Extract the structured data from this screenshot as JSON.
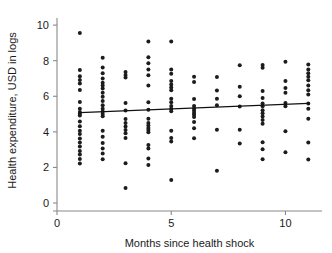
{
  "chart_data": {
    "type": "scatter",
    "title": "",
    "xlabel": "Months since health shock",
    "ylabel": "Health expenditure, USD in logs",
    "xlim": [
      0,
      11.6
    ],
    "ylim": [
      0,
      10.4
    ],
    "xticks": [
      0,
      5,
      10
    ],
    "xtick_labels": [
      "0",
      "5",
      "10"
    ],
    "yticks": [
      0,
      2,
      4,
      6,
      8,
      10
    ],
    "ytick_labels": [
      "0",
      "2",
      "4",
      "6",
      "8",
      "10"
    ],
    "grid": false,
    "legend": false,
    "legend_position": "none",
    "marker": "filled-circle",
    "marker_color": "#1c1c1c",
    "fit_line": {
      "label": "linear fit",
      "color": "#111111",
      "x_start": 1.0,
      "y_start": 5.08,
      "x_end": 11.0,
      "y_end": 5.6,
      "slope": 0.052,
      "intercept": 5.03
    },
    "points": [
      [
        1,
        9.55
      ],
      [
        1,
        7.47
      ],
      [
        1,
        7.12
      ],
      [
        1,
        6.92
      ],
      [
        1,
        6.72
      ],
      [
        1,
        6.35
      ],
      [
        1,
        5.68
      ],
      [
        1,
        5.3
      ],
      [
        1,
        5.12
      ],
      [
        1,
        5.02
      ],
      [
        1,
        4.92
      ],
      [
        1,
        4.58
      ],
      [
        1,
        4.32
      ],
      [
        1,
        4.06
      ],
      [
        1,
        3.88
      ],
      [
        1,
        3.62
      ],
      [
        1,
        3.4
      ],
      [
        1,
        3.18
      ],
      [
        1,
        2.92
      ],
      [
        1,
        2.72
      ],
      [
        1,
        2.48
      ],
      [
        1,
        2.22
      ],
      [
        2,
        8.16
      ],
      [
        2,
        7.62
      ],
      [
        2,
        7.3
      ],
      [
        2,
        7.0
      ],
      [
        2,
        6.76
      ],
      [
        2,
        6.6
      ],
      [
        2,
        6.44
      ],
      [
        2,
        6.2
      ],
      [
        2,
        5.98
      ],
      [
        2,
        5.74
      ],
      [
        2,
        5.5
      ],
      [
        2,
        5.3
      ],
      [
        2,
        5.14
      ],
      [
        2,
        5.0
      ],
      [
        2,
        4.88
      ],
      [
        2,
        4.06
      ],
      [
        2,
        3.72
      ],
      [
        2,
        3.38
      ],
      [
        2,
        3.06
      ],
      [
        2,
        2.78
      ],
      [
        2,
        2.46
      ],
      [
        3,
        7.36
      ],
      [
        3,
        7.2
      ],
      [
        3,
        7.06
      ],
      [
        3,
        5.62
      ],
      [
        3,
        5.2
      ],
      [
        3,
        4.72
      ],
      [
        3,
        4.5
      ],
      [
        3,
        4.3
      ],
      [
        3,
        4.1
      ],
      [
        3,
        3.92
      ],
      [
        3,
        3.66
      ],
      [
        3,
        2.24
      ],
      [
        3,
        0.84
      ],
      [
        4,
        9.08
      ],
      [
        4,
        8.2
      ],
      [
        4,
        7.86
      ],
      [
        4,
        7.5
      ],
      [
        4,
        7.18
      ],
      [
        4,
        6.6
      ],
      [
        4,
        5.66
      ],
      [
        4,
        5.24
      ],
      [
        4,
        4.74
      ],
      [
        4,
        4.5
      ],
      [
        4,
        4.36
      ],
      [
        4,
        4.22
      ],
      [
        4,
        4.1
      ],
      [
        4,
        3.98
      ],
      [
        4,
        3.26
      ],
      [
        4,
        3.06
      ],
      [
        4,
        2.5
      ],
      [
        4,
        2.14
      ],
      [
        5,
        9.08
      ],
      [
        5,
        7.5
      ],
      [
        5,
        7.26
      ],
      [
        5,
        6.86
      ],
      [
        5,
        6.66
      ],
      [
        5,
        6.5
      ],
      [
        5,
        6.34
      ],
      [
        5,
        5.86
      ],
      [
        5,
        5.66
      ],
      [
        5,
        5.46
      ],
      [
        5,
        5.3
      ],
      [
        5,
        5.16
      ],
      [
        5,
        4.06
      ],
      [
        5,
        3.66
      ],
      [
        5,
        3.46
      ],
      [
        5,
        1.3
      ],
      [
        6,
        7.1
      ],
      [
        6,
        6.8
      ],
      [
        6,
        5.84
      ],
      [
        6,
        5.46
      ],
      [
        6,
        5.3
      ],
      [
        6,
        5.18
      ],
      [
        6,
        5.06
      ],
      [
        6,
        4.96
      ],
      [
        6,
        4.84
      ],
      [
        6,
        4.56
      ],
      [
        6,
        4.2
      ],
      [
        6,
        3.64
      ],
      [
        7,
        7.08
      ],
      [
        7,
        6.32
      ],
      [
        7,
        5.86
      ],
      [
        7,
        5.5
      ],
      [
        7,
        4.12
      ],
      [
        7,
        1.82
      ],
      [
        8,
        7.74
      ],
      [
        8,
        6.54
      ],
      [
        8,
        6.0
      ],
      [
        8,
        5.42
      ],
      [
        8,
        4.12
      ],
      [
        8,
        3.34
      ],
      [
        9,
        7.76
      ],
      [
        9,
        7.6
      ],
      [
        9,
        6.3
      ],
      [
        9,
        5.9
      ],
      [
        9,
        5.6
      ],
      [
        9,
        5.44
      ],
      [
        9,
        5.22
      ],
      [
        9,
        5.04
      ],
      [
        9,
        4.86
      ],
      [
        9,
        4.66
      ],
      [
        9,
        4.46
      ],
      [
        9,
        3.42
      ],
      [
        9,
        3.02
      ],
      [
        9,
        2.46
      ],
      [
        10,
        7.94
      ],
      [
        10,
        6.86
      ],
      [
        10,
        6.46
      ],
      [
        10,
        6.2
      ],
      [
        10,
        5.62
      ],
      [
        10,
        5.44
      ],
      [
        10,
        4.04
      ],
      [
        10,
        2.86
      ],
      [
        11,
        7.78
      ],
      [
        11,
        7.5
      ],
      [
        11,
        7.3
      ],
      [
        11,
        7.1
      ],
      [
        11,
        6.9
      ],
      [
        11,
        6.6
      ],
      [
        11,
        6.34
      ],
      [
        11,
        6.1
      ],
      [
        11,
        5.6
      ],
      [
        11,
        5.3
      ],
      [
        11,
        4.74
      ],
      [
        11,
        3.4
      ],
      [
        11,
        2.44
      ]
    ]
  }
}
